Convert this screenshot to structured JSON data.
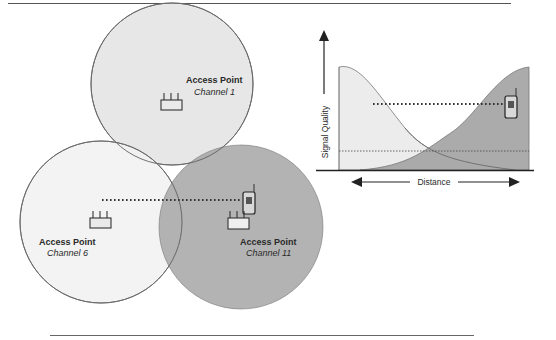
{
  "figure": {
    "colors": {
      "background": "#ffffff",
      "rule": "#555555",
      "channel1_fill": "#e4e4e4",
      "channel6_fill": "#f2f2f2",
      "channel11_fill": "#a9a9a9",
      "outline": "#666666",
      "curve_light_fill": "#ececec",
      "curve_dark_fill": "#a6a6a6",
      "text": "#2a2a2a"
    },
    "access_points": [
      {
        "title": "Access Point",
        "channel": "Channel 1"
      },
      {
        "title": "Access Point",
        "channel": "Channel 6"
      },
      {
        "title": "Access Point",
        "channel": "Channel 11"
      }
    ],
    "graph": {
      "y_axis_label": "Signal Quality",
      "x_axis_label": "Distance"
    }
  }
}
